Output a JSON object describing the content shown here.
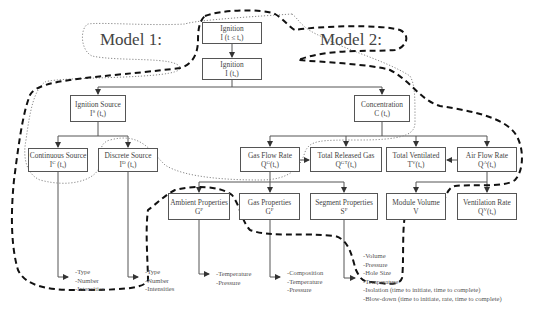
{
  "models": [
    {
      "label": "Model 1:",
      "outline_style": "dotted"
    },
    {
      "label": "Model 2:",
      "outline_style": "dashed"
    }
  ],
  "nodes": {
    "ignition_pre": {
      "title": "Ignition",
      "symbol": "I",
      "sup": "",
      "args": "(t ≤ t",
      "sub": "s",
      "close": ")"
    },
    "ignition": {
      "title": "Ignition",
      "symbol": "I",
      "sup": "",
      "args": "(t",
      "sub": "s",
      "close": ")"
    },
    "ignition_source": {
      "title": "Ignition Source",
      "symbol": "I",
      "sup": "S",
      "args": "(t",
      "sub": "s",
      "close": ")"
    },
    "concentration": {
      "title": "Concentration",
      "symbol": "C",
      "sup": "",
      "args": "(t",
      "sub": "s",
      "close": ")"
    },
    "continuous_source": {
      "title": "Continuous Source",
      "symbol": "I",
      "sup": "C",
      "args": "(t",
      "sub": "s",
      "close": ")"
    },
    "discrete_source": {
      "title": "Discrete Source",
      "symbol": "I",
      "sup": "D",
      "args": "(t",
      "sub": "s",
      "close": ")"
    },
    "gas_flow_rate": {
      "title": "Gas Flow Rate",
      "symbol": "Q",
      "sup": "G",
      "args": "(t",
      "sub": "s",
      "close": ")"
    },
    "total_released_gas": {
      "title": "Total Released Gas",
      "symbol": "Q",
      "sup": "GT",
      "args": "(t",
      "sub": "s",
      "close": ")"
    },
    "total_ventilated": {
      "title": "Total Ventilated",
      "symbol": "T",
      "sup": "V",
      "args": "(t",
      "sub": "s",
      "close": ")"
    },
    "air_flow_rate": {
      "title": "Air Flow Rate",
      "symbol": "Q",
      "sup": "A",
      "args": "(t",
      "sub": "s",
      "close": ")"
    },
    "ambient_properties": {
      "title": "Ambient Properties",
      "symbol": "G",
      "sup": "P",
      "args": "",
      "sub": "",
      "close": ""
    },
    "gas_properties": {
      "title": "Gas Properties",
      "symbol": "G",
      "sup": "P",
      "args": "",
      "sub": "",
      "close": ""
    },
    "segment_properties": {
      "title": "Segment Properties",
      "symbol": "S",
      "sup": "P",
      "args": "",
      "sub": "",
      "close": ""
    },
    "module_volume": {
      "title": "Module Volume",
      "symbol": "V",
      "sup": "",
      "args": "",
      "sub": "",
      "close": ""
    },
    "ventilation_rate": {
      "title": "Ventilation Rate",
      "symbol": "Q",
      "sup": "V",
      "args": "(t",
      "sub": "s",
      "close": ")"
    }
  },
  "attributes": {
    "continuous_source": [
      "-Type",
      "-Number",
      "-Intensities"
    ],
    "discrete_source": [
      "-Type",
      "-Number",
      "-Intensities"
    ],
    "ambient_properties": [
      "-Temperature",
      "-Pressure"
    ],
    "gas_properties": [
      "-Composition",
      "-Temperature",
      "-Pressure"
    ],
    "segment_properties": [
      "-Volume",
      "-Pressure",
      "-Hole Size",
      "-Temperature",
      "-Isolation (time to initiate, time to complete)",
      "-Blow-down (time to initiate, rate, time to complete)"
    ]
  },
  "colors": {
    "line": "#555555",
    "outline": "#111111",
    "dotted": "#888888",
    "background": "#ffffff"
  }
}
